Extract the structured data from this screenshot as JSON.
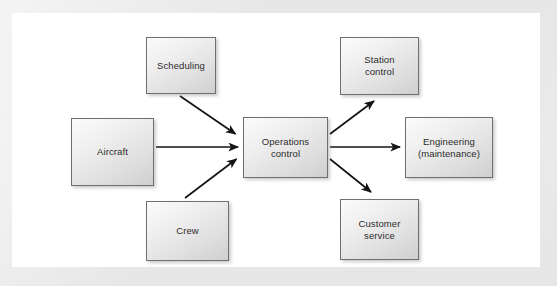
{
  "figure": {
    "background_color": "#e8e8e8",
    "panel_color": "#ffffff",
    "box_border_color": "#6f6f6f",
    "box_fill_start": "#fbfbfb",
    "box_fill_end": "#cfcfcf",
    "arrow_color": "#1a1a1a",
    "label_color": "#2b2b2b"
  },
  "nodes": [
    {
      "id": "scheduling",
      "label": "Scheduling",
      "role": "input"
    },
    {
      "id": "aircraft",
      "label": "Aircraft",
      "role": "input"
    },
    {
      "id": "crew",
      "label": "Crew",
      "role": "input"
    },
    {
      "id": "operations",
      "label": "Operations\ncontrol",
      "role": "center"
    },
    {
      "id": "station",
      "label": "Station\ncontrol",
      "role": "output"
    },
    {
      "id": "engineering",
      "label": "Engineering\n(maintenance)",
      "role": "output"
    },
    {
      "id": "customer",
      "label": "Customer\nservice",
      "role": "output"
    }
  ],
  "edges": [
    {
      "id": "scheduling-to-operations",
      "from": "Scheduling",
      "to": "Operations control",
      "direction": "down-right"
    },
    {
      "id": "aircraft-to-operations",
      "from": "Aircraft",
      "to": "Operations control",
      "direction": "right"
    },
    {
      "id": "crew-to-operations",
      "from": "Crew",
      "to": "Operations control",
      "direction": "up-right"
    },
    {
      "id": "operations-to-station",
      "from": "Operations control",
      "to": "Station control",
      "direction": "up-right"
    },
    {
      "id": "operations-to-engineering",
      "from": "Operations control",
      "to": "Engineering (maintenance)",
      "direction": "right"
    },
    {
      "id": "operations-to-customer",
      "from": "Operations control",
      "to": "Customer service",
      "direction": "down-right"
    }
  ],
  "caption": {
    "text": ""
  }
}
